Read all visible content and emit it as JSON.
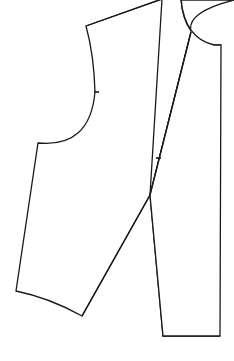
{
  "diagram": {
    "type": "sewing-pattern",
    "stroke_color": "#1a1a1a",
    "background_color": "#ffffff",
    "pieces": [
      {
        "name": "front-panel",
        "notches": 1
      },
      {
        "name": "side-back-panel",
        "notches": 1
      }
    ]
  }
}
